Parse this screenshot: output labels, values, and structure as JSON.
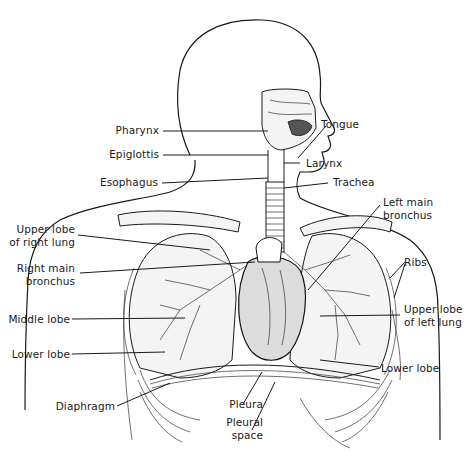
{
  "diagram": {
    "labels": {
      "pharynx": "Pharynx",
      "tongue": "Tongue",
      "epiglottis": "Epiglottis",
      "larynx": "Larynx",
      "esophagus": "Esophagus",
      "trachea": "Trachea",
      "left_main_bronchus_1": "Left main",
      "left_main_bronchus_2": "bronchus",
      "upper_lobe_right_1": "Upper lobe",
      "upper_lobe_right_2": "of right lung",
      "right_main_bronchus_1": "Right main",
      "right_main_bronchus_2": "bronchus",
      "ribs": "Ribs",
      "middle_lobe": "Middle lobe",
      "upper_lobe_left_1": "Upper lobe",
      "upper_lobe_left_2": "of left lung",
      "lower_lobe_right": "Lower lobe",
      "lower_lobe_left": "Lower lobe",
      "diaphragm": "Diaphragm",
      "pleura": "Pleura",
      "pleural_space_1": "Pleural",
      "pleural_space_2": "space"
    }
  }
}
